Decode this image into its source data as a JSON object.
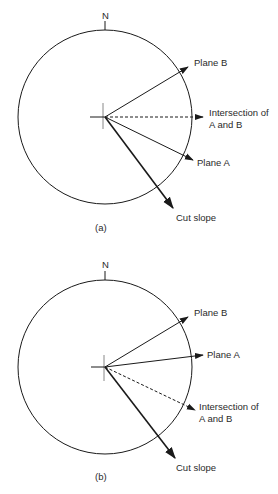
{
  "diagrams": [
    {
      "caption": "(a)",
      "north_label": "N",
      "vectors": {
        "plane_b": "Plane B",
        "intersection_line1": "Intersection of",
        "intersection_line2": "A and B",
        "plane_a": "Plane A",
        "cut_slope": "Cut slope"
      }
    },
    {
      "caption": "(b)",
      "north_label": "N",
      "vectors": {
        "plane_b": "Plane B",
        "plane_a": "Plane A",
        "intersection_line1": "Intersection of",
        "intersection_line2": "A and B",
        "cut_slope": "Cut slope"
      }
    }
  ],
  "colors": {
    "stroke": "#1a1a1a",
    "text": "#2a2a2a",
    "background": "#ffffff"
  }
}
